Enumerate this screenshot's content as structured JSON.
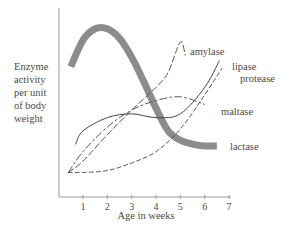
{
  "chart_data": {
    "type": "line",
    "title": "",
    "xlabel": "Age in weeks",
    "ylabel": "Enzyme activity per unit of body weight",
    "ylabel_lines": [
      "Enzyme",
      "activity",
      "per unit",
      "of body",
      "weight"
    ],
    "x_ticks": [
      "1",
      "2",
      "3",
      "4",
      "5",
      "6",
      "7"
    ],
    "xlim": [
      0,
      7
    ],
    "ylim": [
      0,
      100
    ],
    "grid": false,
    "legend_position": "inline labels at curve ends",
    "series": [
      {
        "name": "lactase",
        "style": "thick-gray",
        "color": "#8c8c8c",
        "x": [
          0.5,
          1.0,
          1.5,
          2.0,
          2.5,
          3.0,
          3.5,
          4.0,
          4.5,
          5.0,
          5.5,
          6.0,
          6.5
        ],
        "y": [
          69,
          83,
          89,
          89,
          84,
          74,
          61,
          47,
          35,
          30,
          28,
          27,
          27
        ]
      },
      {
        "name": "amylase",
        "style": "long-dash",
        "color": "#555555",
        "x": [
          0.4,
          1.0,
          2.0,
          3.0,
          4.0,
          4.5,
          5.0,
          5.2
        ],
        "y": [
          13,
          19,
          33,
          46,
          58,
          66,
          82,
          75
        ]
      },
      {
        "name": "lipase",
        "style": "solid-thin",
        "color": "#444444",
        "x": [
          0.7,
          1.0,
          2.0,
          3.0,
          4.0,
          5.0,
          6.0,
          6.6
        ],
        "y": [
          28,
          35,
          42,
          44,
          42,
          44,
          58,
          72
        ]
      },
      {
        "name": "protease",
        "style": "short-dash",
        "color": "#555555",
        "x": [
          0.4,
          1.0,
          2.0,
          3.0,
          4.0,
          5.0,
          6.0,
          6.7
        ],
        "y": [
          13,
          13,
          14,
          18,
          24,
          36,
          54,
          68
        ]
      },
      {
        "name": "maltase",
        "style": "dash-dot",
        "color": "#555555",
        "x": [
          0.4,
          1.0,
          2.0,
          3.0,
          4.0,
          5.0,
          6.0
        ],
        "y": [
          13,
          24,
          37,
          46,
          51,
          53,
          49
        ]
      }
    ],
    "annotations": [
      {
        "text": "amylase",
        "x": 4.8,
        "y": 83
      },
      {
        "text": "lipase",
        "x": 7.0,
        "y": 75
      },
      {
        "text": "protease",
        "x": 7.2,
        "y": 68
      },
      {
        "text": "maltase",
        "x": 6.3,
        "y": 43
      },
      {
        "text": "lactase",
        "x": 7.0,
        "y": 27
      }
    ]
  }
}
